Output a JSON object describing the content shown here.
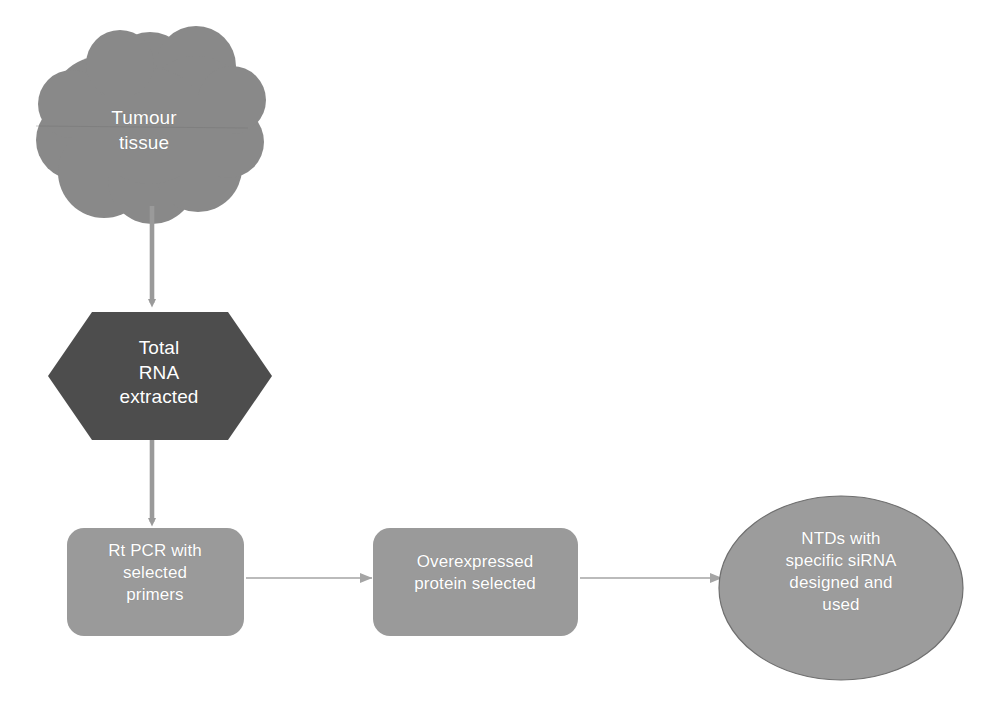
{
  "diagram": {
    "background_color": "#ffffff",
    "colors": {
      "cloud_fill": "#898989",
      "hexagon_fill": "#4d4d4d",
      "box_fill": "#9a9a9a",
      "ellipse_fill": "#9c9c9c",
      "ellipse_stroke": "#6f6f6f",
      "arrow_vertical": "#9a9a9a",
      "arrow_horizontal": "#a8a8a8",
      "label_text": "#ffffff"
    },
    "nodes": [
      {
        "id": "tumour-tissue",
        "shape": "cloud",
        "label": "Tumour\ntissue",
        "fill": "#898989",
        "text_color": "#ffffff"
      },
      {
        "id": "total-rna-extracted",
        "shape": "hexagon",
        "label": "Total\nRNA\nextracted",
        "fill": "#4d4d4d",
        "text_color": "#ffffff"
      },
      {
        "id": "rt-pcr-primers",
        "shape": "rounded-rect",
        "label": "Rt PCR with\nselected\nprimers",
        "fill": "#9a9a9a",
        "text_color": "#ffffff"
      },
      {
        "id": "overexpressed-protein",
        "shape": "rounded-rect",
        "label": "Overexpressed\nprotein selected",
        "fill": "#9a9a9a",
        "text_color": "#ffffff"
      },
      {
        "id": "ntds-sirna",
        "shape": "ellipse",
        "label": "NTDs with\nspecific siRNA\ndesigned  and\nused",
        "fill": "#9c9c9c",
        "text_color": "#ffffff"
      }
    ],
    "connectors": [
      {
        "id": "arrow-tumour-to-rna",
        "from": "tumour-tissue",
        "to": "total-rna-extracted",
        "direction": "down",
        "style": "solid-arrow"
      },
      {
        "id": "arrow-rna-to-pcr",
        "from": "total-rna-extracted",
        "to": "rt-pcr-primers",
        "direction": "down",
        "style": "solid-arrow"
      },
      {
        "id": "arrow-pcr-to-protein",
        "from": "rt-pcr-primers",
        "to": "overexpressed-protein",
        "direction": "right",
        "style": "thin-arrow"
      },
      {
        "id": "arrow-protein-to-ntds",
        "from": "overexpressed-protein",
        "to": "ntds-sirna",
        "direction": "right",
        "style": "thin-arrow"
      }
    ],
    "artifacts": {
      "ghost_text_1": "",
      "ghost_text_2": ""
    }
  }
}
